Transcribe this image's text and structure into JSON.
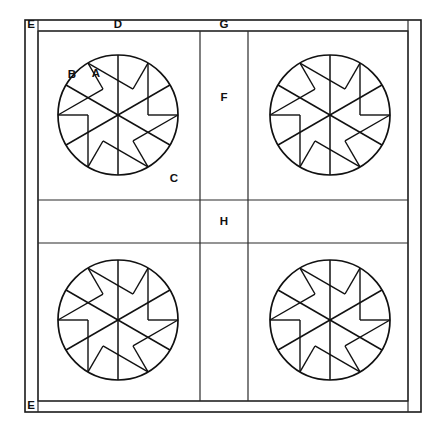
{
  "figure": {
    "background": "#ffffff",
    "line_color": "#111111",
    "width": 446,
    "height": 430
  },
  "frame": {
    "outer": {
      "x": 25,
      "y": 20,
      "w": 396,
      "h": 392
    },
    "inner": {
      "x": 38,
      "y": 31,
      "w": 370,
      "h": 370
    },
    "margin_left_x": 38,
    "margin_right_x": 408,
    "margin_top_y": 31,
    "margin_bottom_y": 401,
    "v_divider_1": 200,
    "v_divider_2": 248,
    "h_divider_1": 200,
    "h_divider_2": 243
  },
  "labels": [
    {
      "id": "E",
      "text": "E",
      "x": 31,
      "y": 25,
      "target": "outer-margin-frame"
    },
    {
      "id": "D",
      "text": "D",
      "x": 118,
      "y": 25,
      "target": "upper-left-panel"
    },
    {
      "id": "G",
      "text": "G",
      "x": 224,
      "y": 25,
      "target": "center-column"
    },
    {
      "id": "A",
      "text": "A",
      "x": 96,
      "y": 74,
      "target": "blade-sector"
    },
    {
      "id": "B",
      "text": "B",
      "x": 72,
      "y": 75,
      "target": "blade-tab"
    },
    {
      "id": "C",
      "text": "C",
      "x": 174,
      "y": 179,
      "target": "rotor-disc"
    },
    {
      "id": "F",
      "text": "F",
      "x": 224,
      "y": 98,
      "target": "center-upper-cell"
    },
    {
      "id": "H",
      "text": "H",
      "x": 224,
      "y": 222,
      "target": "center-middle-cell"
    },
    {
      "id": "E2",
      "text": "E",
      "x": 31,
      "y": 406,
      "target": "outer-margin-frame-bottom"
    }
  ],
  "rotors": [
    {
      "name": "rotor-top-left",
      "cx": 118,
      "cy": 115,
      "r": 60
    },
    {
      "name": "rotor-top-right",
      "cx": 330,
      "cy": 115,
      "r": 60
    },
    {
      "name": "rotor-bottom-left",
      "cx": 118,
      "cy": 320,
      "r": 60
    },
    {
      "name": "rotor-bottom-right",
      "cx": 330,
      "cy": 320,
      "r": 60
    }
  ],
  "rotor_pattern": {
    "spoke_count": 6,
    "spoke_angles_deg": [
      90,
      150,
      210,
      270,
      330,
      30
    ],
    "chord_offset_ratio": 0.5,
    "tab_length_ratio": 0.3,
    "description": "Six radial spokes from hub; each sector carries an offset chord parallel to the leading spoke plus a short tab near the rim."
  }
}
